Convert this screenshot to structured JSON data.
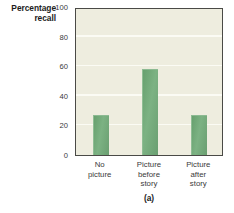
{
  "chart_data": {
    "type": "bar",
    "title": "",
    "caption": "(a)",
    "xlabel": "",
    "ylabel": "Percentage recall",
    "ylabel_lines": [
      "Percentage",
      "recall"
    ],
    "categories": [
      "No picture",
      "Picture before story",
      "Picture after story"
    ],
    "category_lines": [
      [
        "No",
        "picture"
      ],
      [
        "Picture",
        "before",
        "story"
      ],
      [
        "Picture",
        "after",
        "story"
      ]
    ],
    "values": [
      27,
      58,
      27
    ],
    "ylim": [
      0,
      100
    ],
    "yticks": [
      100,
      80,
      60,
      40,
      20,
      0
    ],
    "ytick_labels": [
      "100",
      "80",
      "60",
      "40",
      "20",
      "0"
    ],
    "grid": true,
    "grid_axis": "y",
    "legend": false,
    "bar_color": "#6fa678",
    "plot_background": "#eeeddf",
    "gridline_color": "#fbfbf4",
    "border_color": "#4a4a46"
  }
}
